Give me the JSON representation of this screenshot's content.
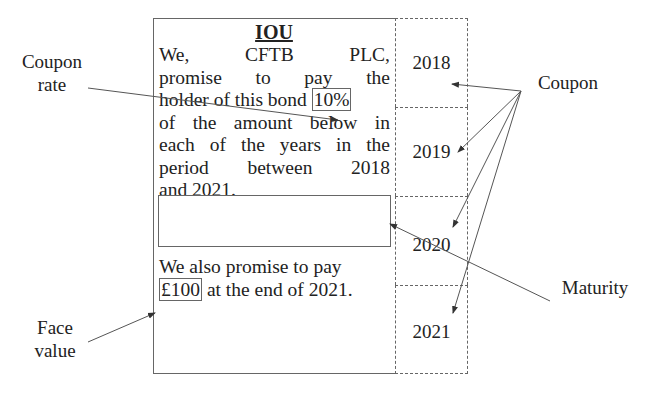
{
  "iou": {
    "title": "IOU",
    "paragraph1": {
      "line1": "We, CFTB PLC,",
      "line1_words": [
        "We,",
        "CFTB",
        "PLC,"
      ],
      "line2": "promise to pay the",
      "line3_prefix": "holder of this bond",
      "line3_highlight": "10%",
      "line4": "of the amount below in",
      "line5": "each of the years in the",
      "line6": "period between 2018",
      "line7": "and 2021."
    },
    "paragraph2": {
      "line1": "We also promise to pay",
      "line2_highlight": "£100",
      "line2_suffix": "at the end of 2021."
    }
  },
  "years": [
    "2018",
    "2019",
    "2020",
    "2021"
  ],
  "labels": {
    "coupon_rate_line1": "Coupon",
    "coupon_rate_line2": "rate",
    "coupon": "Coupon",
    "maturity": "Maturity",
    "face_value_line1": "Face",
    "face_value_line2": "value"
  },
  "colors": {
    "line": "#555555",
    "text": "#222222",
    "background": "#ffffff"
  }
}
